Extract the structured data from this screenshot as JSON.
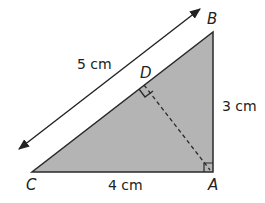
{
  "diagram": {
    "colors": {
      "fill": "#b4b4b4",
      "stroke": "#2a2a2a"
    },
    "vertices": {
      "A": "A",
      "B": "B",
      "C": "C",
      "D": "D"
    },
    "lengths": {
      "CB": "5 cm",
      "AB": "3 cm",
      "CA": "4 cm"
    }
  }
}
